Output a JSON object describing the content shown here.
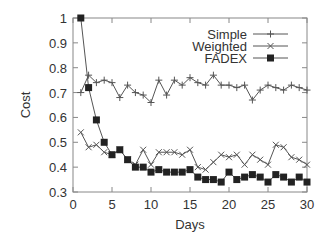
{
  "chart_data": {
    "type": "line",
    "title": "",
    "xlabel": "Days",
    "ylabel": "Cost",
    "xlim": [
      0,
      30
    ],
    "ylim": [
      0.3,
      1.0
    ],
    "xticks": [
      0,
      5,
      10,
      15,
      20,
      25,
      30
    ],
    "yticks": [
      0.3,
      0.4,
      0.5,
      0.6,
      0.7,
      0.8,
      0.9,
      1
    ],
    "ytick_labels": [
      "0.3",
      "0.4",
      "0.5",
      "0.6",
      "0.7",
      "0.8",
      "0.9",
      "1"
    ],
    "grid": false,
    "legend_position": "top-right",
    "x": [
      1,
      2,
      3,
      4,
      5,
      6,
      7,
      8,
      9,
      10,
      11,
      12,
      13,
      14,
      15,
      16,
      17,
      18,
      19,
      20,
      21,
      22,
      23,
      24,
      25,
      26,
      27,
      28,
      29,
      30
    ],
    "series": [
      {
        "name": "Simple",
        "marker": "plus",
        "values": [
          0.7,
          0.77,
          0.74,
          0.75,
          0.74,
          0.68,
          0.73,
          0.7,
          0.69,
          0.66,
          0.75,
          0.69,
          0.75,
          0.73,
          0.76,
          0.74,
          0.73,
          0.77,
          0.73,
          0.73,
          0.72,
          0.73,
          0.67,
          0.71,
          0.73,
          0.72,
          0.71,
          0.73,
          0.72,
          0.71
        ]
      },
      {
        "name": "Weighted",
        "marker": "cross",
        "values": [
          0.54,
          0.48,
          0.49,
          0.46,
          0.45,
          0.47,
          0.43,
          0.41,
          0.47,
          0.41,
          0.46,
          0.46,
          0.46,
          0.45,
          0.47,
          0.4,
          0.39,
          0.42,
          0.45,
          0.44,
          0.45,
          0.41,
          0.45,
          0.43,
          0.41,
          0.49,
          0.48,
          0.44,
          0.43,
          0.41
        ]
      },
      {
        "name": "FADEX",
        "marker": "filled-square",
        "values": [
          1.0,
          0.72,
          0.59,
          0.5,
          0.45,
          0.47,
          0.43,
          0.4,
          0.4,
          0.38,
          0.39,
          0.38,
          0.38,
          0.38,
          0.39,
          0.36,
          0.35,
          0.35,
          0.34,
          0.38,
          0.35,
          0.36,
          0.37,
          0.36,
          0.34,
          0.37,
          0.36,
          0.34,
          0.36,
          0.34
        ]
      }
    ]
  },
  "colors": {
    "line": "#555555",
    "marker": "#222222",
    "axis": "#888888",
    "text": "#333333"
  }
}
